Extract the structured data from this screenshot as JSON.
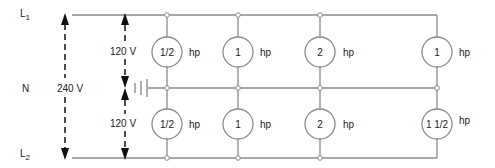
{
  "diagram": {
    "type": "three-wire 120/240 V single-phase distribution with motor loads",
    "lines": {
      "L1": {
        "label": "L",
        "sub": "1"
      },
      "N": {
        "label": "N"
      },
      "L2": {
        "label": "L",
        "sub": "2"
      }
    },
    "voltages": {
      "line_to_line": "240 V",
      "upper_line_to_neutral": "120 V",
      "lower_line_to_neutral": "120 V"
    },
    "unit_label": "hp",
    "upper_motors": [
      {
        "rating": "1/2",
        "unit": "hp"
      },
      {
        "rating": "1",
        "unit": "hp"
      },
      {
        "rating": "2",
        "unit": "hp"
      },
      {
        "rating": "1",
        "unit": "hp"
      }
    ],
    "lower_motors": [
      {
        "rating": "1/2",
        "unit": "hp"
      },
      {
        "rating": "1",
        "unit": "hp"
      },
      {
        "rating": "2",
        "unit": "hp"
      },
      {
        "rating": "1 1/2",
        "unit": "hp"
      }
    ],
    "ground_symbol": "ground-at-neutral",
    "colors": {
      "wire": "#8a8a8a",
      "arrow": "#111111",
      "text": "#222222"
    }
  }
}
